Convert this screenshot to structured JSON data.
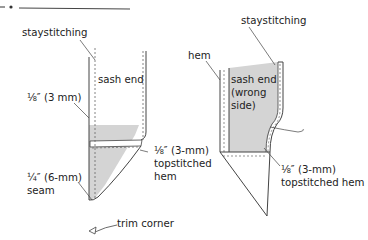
{
  "header": {
    "rule": "decorative-dash-dot-rule"
  },
  "colors": {
    "ink": "#333333",
    "fabric_shade": "#d4d4d4",
    "stitch": "#777777"
  },
  "left_figure": {
    "labels": {
      "staystitching": "staystitching",
      "sash_end": "sash end",
      "eighth_3mm": "⅛″ (3 mm)",
      "topstitched_hem_1": "⅛″ (3-mm)",
      "topstitched_hem_2": "topstitched",
      "topstitched_hem_3": "hem",
      "seam_1": "¼″ (6-mm)",
      "seam_2": "seam",
      "trim_corner": "trim corner"
    }
  },
  "right_figure": {
    "labels": {
      "staystitching": "staystitching",
      "hem": "hem",
      "sash_end_1": "sash end",
      "sash_end_2": "(wrong",
      "sash_end_3": "side)",
      "topstitched_hem_1": "⅛″ (3-mm)",
      "topstitched_hem_2": "topstitched hem"
    }
  }
}
